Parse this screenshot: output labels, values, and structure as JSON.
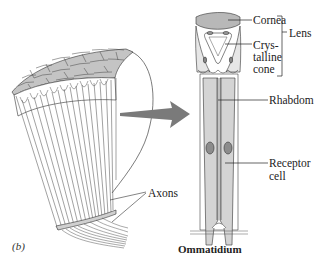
{
  "figure": {
    "panel_label": "(b)",
    "caption": "Ommatidium",
    "colors": {
      "cornea": "#b8b8b8",
      "cell_fill": "#d4d4d4",
      "nucleus": "#8c8c8c",
      "arrow": "#7a7a7a",
      "line": "#333333"
    }
  },
  "labels": {
    "cornea": "Cornea",
    "crystalline_cone_1": "Crys-",
    "crystalline_cone_2": "talline",
    "crystalline_cone_3": "cone",
    "lens": "Lens",
    "rhabdom": "Rhabdom",
    "receptor_cell_1": "Receptor",
    "receptor_cell_2": "cell",
    "axons": "Axons"
  }
}
